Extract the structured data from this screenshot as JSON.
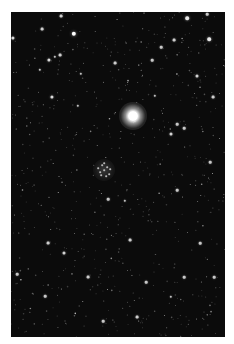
{
  "image": {
    "subject": "star field",
    "background_color": "#0b0b0b",
    "frame": {
      "left": 11,
      "top": 12,
      "width": 214,
      "height": 325
    },
    "bright_star": {
      "x": 122,
      "y": 104
    },
    "cluster": {
      "x": 93,
      "y": 158,
      "members": [
        [
          0,
          0
        ],
        [
          -4,
          2
        ],
        [
          3,
          -3
        ],
        [
          5,
          4
        ],
        [
          -2,
          -5
        ],
        [
          -6,
          -2
        ],
        [
          2,
          6
        ],
        [
          6,
          -1
        ],
        [
          -3,
          5
        ],
        [
          0,
          -7
        ]
      ]
    },
    "notable_stars": [
      [
        63,
        22,
        2.2
      ],
      [
        50,
        4,
        1.4
      ],
      [
        31,
        17,
        1.4
      ],
      [
        2,
        26,
        1.6
      ],
      [
        38,
        48,
        1.6
      ],
      [
        49,
        43,
        1.4
      ],
      [
        70,
        62,
        1.2
      ],
      [
        176,
        6,
        1.8
      ],
      [
        163,
        28,
        1.4
      ],
      [
        150,
        35,
        1.3
      ],
      [
        198,
        27,
        1.8
      ],
      [
        196,
        2,
        1.3
      ],
      [
        44,
        45,
        1.2
      ],
      [
        29,
        58,
        1.2
      ],
      [
        104,
        51,
        1.4
      ],
      [
        141,
        48,
        1.3
      ],
      [
        186,
        64,
        1.5
      ],
      [
        202,
        85,
        1.4
      ],
      [
        41,
        85,
        1.6
      ],
      [
        67,
        94,
        1.2
      ],
      [
        166,
        112,
        1.3
      ],
      [
        160,
        122,
        1.5
      ],
      [
        199,
        150,
        1.3
      ],
      [
        189,
        231,
        1.3
      ],
      [
        37,
        231,
        1.4
      ],
      [
        53,
        241,
        1.5
      ],
      [
        34,
        284,
        1.3
      ],
      [
        29,
        333,
        1.2
      ],
      [
        77,
        265,
        1.4
      ],
      [
        92,
        309,
        1.3
      ],
      [
        119,
        228,
        1.4
      ],
      [
        135,
        270,
        1.3
      ],
      [
        160,
        285,
        1.2
      ],
      [
        126,
        305,
        1.4
      ],
      [
        203,
        265,
        1.3
      ],
      [
        6,
        262,
        1.3
      ],
      [
        166,
        178,
        1.3
      ],
      [
        97,
        187,
        1.3
      ],
      [
        173,
        116,
        1.3
      ],
      [
        144,
        84,
        1.2
      ],
      [
        114,
        189,
        1.2
      ],
      [
        173,
        265,
        1.3
      ]
    ],
    "faint_star_count": 700,
    "faint_seed": 1337
  }
}
